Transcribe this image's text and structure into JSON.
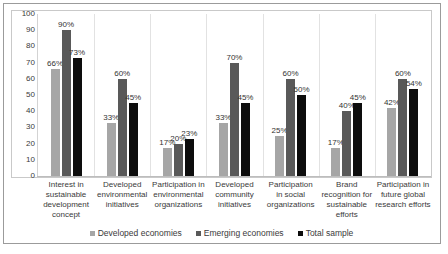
{
  "chart_data": {
    "type": "bar",
    "title": "",
    "subtitle": "",
    "xlabel": "",
    "ylabel": "",
    "ylim": [
      0,
      100
    ],
    "yticks": [
      0,
      10,
      20,
      30,
      40,
      50,
      60,
      70,
      80,
      90,
      100
    ],
    "ytick_labels": [
      "0",
      "10",
      "20",
      "30",
      "40",
      "50",
      "60",
      "70",
      "80",
      "90",
      "100"
    ],
    "grid": false,
    "legend_position": "bottom",
    "value_label_suffix": "%",
    "categories": [
      "Interest in sustainable development concept",
      "Developed environmental initiatives",
      "Participation in environmental organizations",
      "Developed community initiatives",
      "Participation in social organizations",
      "Brand recognition for sustainable efforts",
      "Participation in future global research efforts"
    ],
    "category_lines": [
      [
        "Interest in",
        "sustainable",
        "development",
        "concept"
      ],
      [
        "Developed",
        "environmental",
        "initiatives"
      ],
      [
        "Participation in",
        "environmental",
        "organizations"
      ],
      [
        "Developed",
        "community",
        "initiatives"
      ],
      [
        "Participation",
        "in social",
        "organizations"
      ],
      [
        "Brand",
        "recognition for",
        "sustainable",
        "efforts"
      ],
      [
        "Participation in",
        "future global",
        "research efforts"
      ]
    ],
    "series": [
      {
        "name": "Developed economies",
        "color": "#a6a6a6",
        "values": [
          66,
          33,
          17,
          33,
          25,
          17,
          42
        ],
        "labels": [
          "66%",
          "33%",
          "17%",
          "33%",
          "25%",
          "17%",
          "42%"
        ]
      },
      {
        "name": "Emerging economies",
        "color": "#595959",
        "values": [
          90,
          60,
          20,
          70,
          60,
          40,
          60
        ],
        "labels": [
          "90%",
          "60%",
          "20%",
          "70%",
          "60%",
          "40%",
          "60%"
        ]
      },
      {
        "name": "Total sample",
        "color": "#0d0d0d",
        "values": [
          73,
          45,
          23,
          45,
          50,
          45,
          54
        ],
        "labels": [
          "73%",
          "45%",
          "23%",
          "45%",
          "50%",
          "45%",
          "54%"
        ]
      }
    ]
  },
  "legend": {
    "items": [
      {
        "label": "Developed economies",
        "color": "#a6a6a6"
      },
      {
        "label": "Emerging economies",
        "color": "#595959"
      },
      {
        "label": "Total sample",
        "color": "#0d0d0d"
      }
    ]
  }
}
